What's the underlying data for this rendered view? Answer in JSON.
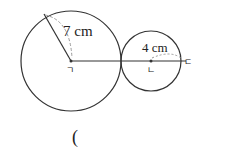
{
  "diagram": {
    "big_circle": {
      "center_label": "ㄱ",
      "radius_label": "7 cm"
    },
    "small_circle": {
      "center_label": "ㄴ",
      "radius_label": "4 cm"
    },
    "end_point_label": "ㄷ",
    "answer_paren": "(",
    "colors": {
      "stroke": "#333333",
      "dashed": "#999999",
      "background": "#ffffff"
    }
  }
}
